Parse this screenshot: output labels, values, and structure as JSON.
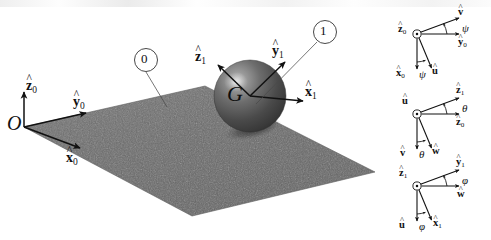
{
  "figure": {
    "background_color": "#ffffff",
    "width": 491,
    "height": 240
  },
  "colors": {
    "plane_fill": "#6b6b6b",
    "plane_edge": "#4a4a4a",
    "sphere_dark": "#3b3b3b",
    "sphere_mid": "#6f6f6f",
    "sphere_light": "#b9b9b9",
    "shadow": "#4c4c4c",
    "ink": "#111111",
    "leader_line": "#444444"
  },
  "scene": {
    "origin_label": "O",
    "body_center_label": "G",
    "ground_frame": {
      "name": "frame-0",
      "axes": [
        {
          "name": "z0",
          "base": "z",
          "sub": "0",
          "hat": true
        },
        {
          "name": "y0",
          "base": "y",
          "sub": "0",
          "hat": true
        },
        {
          "name": "x0",
          "base": "x",
          "sub": "0",
          "hat": true
        }
      ]
    },
    "body_frame": {
      "name": "frame-1",
      "axes": [
        {
          "name": "z1",
          "base": "z",
          "sub": "1",
          "hat": true
        },
        {
          "name": "y1",
          "base": "y",
          "sub": "1",
          "hat": true
        },
        {
          "name": "x1",
          "base": "x",
          "sub": "1",
          "hat": true
        }
      ]
    },
    "balloons": [
      {
        "name": "balloon-0",
        "label": "0"
      },
      {
        "name": "balloon-1",
        "label": "1"
      }
    ]
  },
  "euler_diagrams": [
    {
      "name": "yaw-diagram",
      "angle_symbol": "ψ",
      "out_of_page_axis": {
        "base": "z",
        "sub": "0",
        "hat": true
      },
      "upper_rotated_axis": {
        "base": "v",
        "sub": "",
        "hat": true
      },
      "upper_reference_axis": {
        "base": "y",
        "sub": "0",
        "hat": true
      },
      "lower_reference_axis": {
        "base": "x",
        "sub": "0",
        "hat": true
      },
      "lower_rotated_axis": {
        "base": "u",
        "sub": "",
        "hat": true
      }
    },
    {
      "name": "pitch-diagram",
      "angle_symbol": "θ",
      "out_of_page_axis": {
        "base": "u",
        "sub": "",
        "hat": true
      },
      "upper_rotated_axis": {
        "base": "z",
        "sub": "1",
        "hat": true
      },
      "upper_reference_axis": {
        "base": "z",
        "sub": "0",
        "hat": true
      },
      "lower_reference_axis": {
        "base": "v",
        "sub": "",
        "hat": true
      },
      "lower_rotated_axis": {
        "base": "w",
        "sub": "",
        "hat": true
      }
    },
    {
      "name": "roll-diagram",
      "angle_symbol": "φ",
      "out_of_page_axis": {
        "base": "z",
        "sub": "1",
        "hat": true
      },
      "upper_rotated_axis": {
        "base": "y",
        "sub": "1",
        "hat": true
      },
      "upper_reference_axis": {
        "base": "w",
        "sub": "",
        "hat": true
      },
      "lower_reference_axis": {
        "base": "u",
        "sub": "",
        "hat": true
      },
      "lower_rotated_axis": {
        "base": "x",
        "sub": "1",
        "hat": true
      }
    }
  ],
  "labels": {
    "hat_glyph": "^",
    "dot_glyph": "·"
  }
}
